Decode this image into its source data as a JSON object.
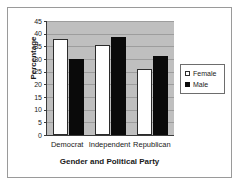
{
  "chart_data": {
    "type": "bar",
    "title": "",
    "xlabel": "Gender and Political Party",
    "ylabel": "Percentage",
    "categories": [
      "Democrat",
      "Independent",
      "Republican"
    ],
    "series": [
      {
        "name": "Female",
        "values": [
          38,
          35.5,
          26
        ],
        "color": "#ffffff"
      },
      {
        "name": "Male",
        "values": [
          30,
          38.5,
          31
        ],
        "color": "#0a0a0a"
      }
    ],
    "ylim": [
      0,
      45
    ],
    "ytick_step": 5,
    "yticks": [
      "0",
      "5",
      "10",
      "15",
      "20",
      "25",
      "30",
      "35",
      "40",
      "45"
    ],
    "grid": true,
    "legend_position": "right",
    "plot_background": "#bfbfbf",
    "axis_color": "#3a3a3a",
    "frame_color": "#9a9a9a"
  }
}
